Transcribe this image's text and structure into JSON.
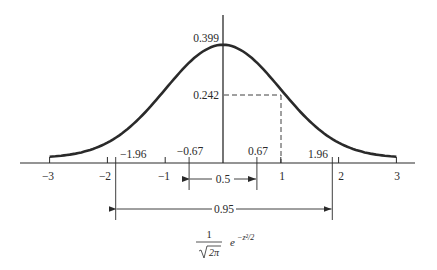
{
  "diagram": {
    "formula": {
      "numerator": "1",
      "denominator": "2π",
      "exponent_base": "e",
      "exponent": "−z²/2"
    },
    "peak_label": "0.399",
    "value_at_1_label": "0.242",
    "axis_ticks": [
      "−3",
      "−2",
      "−1",
      "1",
      "2",
      "3"
    ],
    "axis_tick_values": [
      -3,
      -2,
      -1,
      1,
      2,
      3
    ],
    "marked_points": [
      "−1.96",
      "−0.67",
      "0.67",
      "1.96"
    ],
    "marked_point_values": [
      -1.96,
      -0.67,
      0.67,
      1.96
    ],
    "interval_50": {
      "label": "0.5",
      "from": -0.67,
      "to": 0.67
    },
    "interval_95": {
      "label": "0.95",
      "from": -1.96,
      "to": 1.96
    },
    "colors": {
      "ink": "#2a2a2a",
      "background": "#ffffff"
    }
  }
}
